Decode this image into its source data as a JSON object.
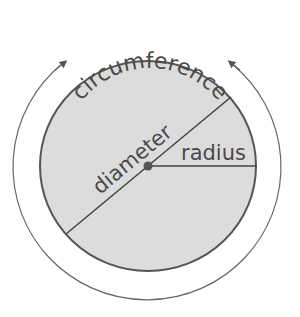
{
  "labels": {
    "circumference": "circumference",
    "diameter": "diameter",
    "radius": "radius"
  },
  "colors": {
    "fill": "#dcdcdc",
    "stroke": "#555555",
    "text": "#4a4a4a"
  }
}
